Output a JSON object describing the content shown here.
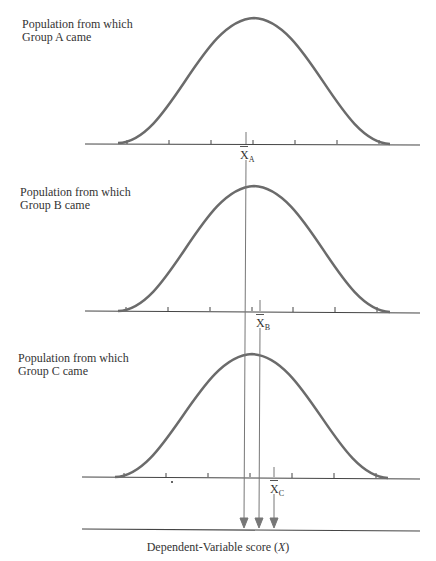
{
  "panels": [
    {
      "label_line1": "Population from which",
      "label_line2": "Group A came",
      "mean_symbol": "X",
      "mean_sub": "A"
    },
    {
      "label_line1": "Population from which",
      "label_line2": "Group B came",
      "mean_symbol": "X",
      "mean_sub": "B"
    },
    {
      "label_line1": "Population from which",
      "label_line2": "Group C came",
      "mean_symbol": "X",
      "mean_sub": "C"
    }
  ],
  "axis": {
    "label": "Dependent-Variable score (",
    "label_var": "X",
    "label_end": ")"
  },
  "colors": {
    "curve": "#6b6b6b",
    "axis": "#444444",
    "arrow": "#777777"
  }
}
